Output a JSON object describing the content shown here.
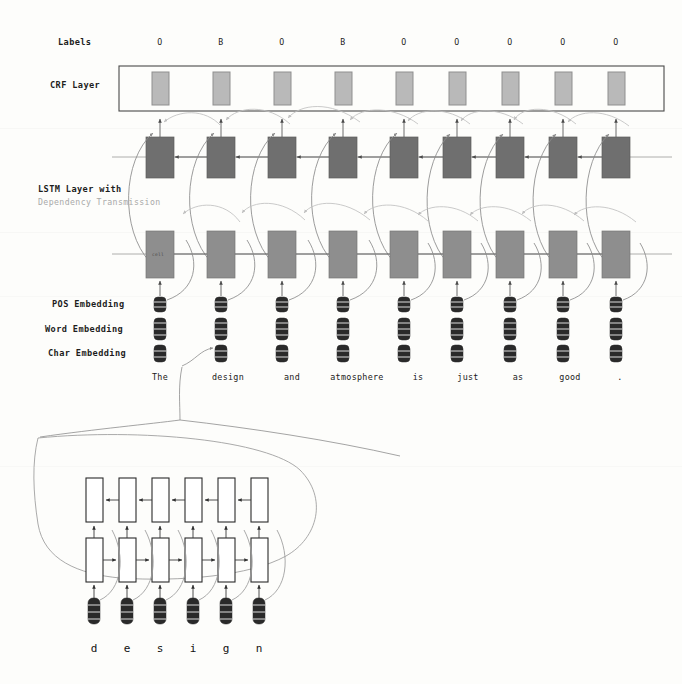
{
  "figure": {
    "type": "diagram",
    "background_color": "#fdfdfb"
  },
  "row_labels": {
    "labels": "Labels",
    "crf_layer": "CRF Layer",
    "lstm_layer_line1": "LSTM Layer with",
    "lstm_layer_line2": "Dependency Transmission",
    "pos_embedding": "POS Embedding",
    "word_embedding": "Word Embedding",
    "char_embedding": "Char Embedding"
  },
  "tags": [
    "O",
    "B",
    "O",
    "B",
    "O",
    "O",
    "O",
    "O",
    "O"
  ],
  "tokens": [
    "The",
    "design",
    "and",
    "atmosphere",
    "is",
    "just",
    "as",
    "good",
    "."
  ],
  "cell_annotation": "cell",
  "char_subgraph": {
    "expanded_token": "design",
    "characters": [
      "d",
      "e",
      "s",
      "i",
      "g",
      "n"
    ]
  },
  "colors": {
    "crf_box": "#b9b9b9",
    "lstm_backward": "#6f6f6f",
    "lstm_forward": "#8e8e8e",
    "embedding": "#2a2a2a",
    "dependency_arc": "#c0c0c0",
    "chain_arc": "#8a8a8a",
    "char_box_fill": "#ffffff",
    "char_box_stroke": "#2b2b2b"
  },
  "geometry": {
    "num_positions": 9,
    "num_characters": 6,
    "column_x": [
      160,
      221,
      282,
      343,
      404,
      457,
      510,
      563,
      616
    ],
    "crf_row_y": 88,
    "backward_row_y": 157,
    "forward_row_y": 254,
    "token_row_y": 377
  }
}
